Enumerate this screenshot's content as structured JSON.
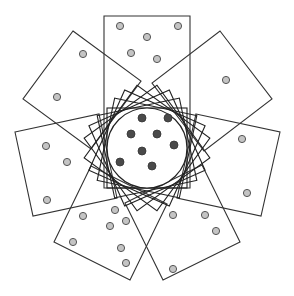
{
  "diagram": {
    "width": 294,
    "height": 296,
    "colors": {
      "background": "#ffffff",
      "stroke": "#333333",
      "light_dot": "#c4c4c4",
      "dark_dot": "#4a4a4a"
    },
    "center_circle": {
      "cx": 147,
      "cy": 148,
      "r": 40
    },
    "inner_rotated_squares": [
      {
        "angle": 0,
        "size": 80
      },
      {
        "angle": 12,
        "size": 84
      },
      {
        "angle": 24,
        "size": 88
      },
      {
        "angle": -12,
        "size": 84
      },
      {
        "angle": -24,
        "size": 88
      },
      {
        "angle": 36,
        "size": 90
      },
      {
        "angle": -36,
        "size": 90
      }
    ],
    "outer_frames": [
      {
        "name": "top",
        "points": [
          [
            104,
            16
          ],
          [
            190,
            16
          ],
          [
            190,
            188
          ],
          [
            104,
            188
          ]
        ]
      },
      {
        "name": "upper-left",
        "points": [
          [
            73,
            31
          ],
          [
            141,
            81
          ],
          [
            91,
            149
          ],
          [
            23,
            99
          ]
        ]
      },
      {
        "name": "upper-right",
        "points": [
          [
            220,
            31
          ],
          [
            272,
            99
          ],
          [
            204,
            151
          ],
          [
            152,
            83
          ]
        ]
      },
      {
        "name": "left",
        "points": [
          [
            15,
            132
          ],
          [
            99,
            114
          ],
          [
            117,
            198
          ],
          [
            33,
            216
          ]
        ]
      },
      {
        "name": "right",
        "points": [
          [
            196,
            114
          ],
          [
            280,
            132
          ],
          [
            261,
            216
          ],
          [
            177,
            198
          ]
        ]
      },
      {
        "name": "bottom-left",
        "points": [
          [
            91,
            166
          ],
          [
            167,
            204
          ],
          [
            130,
            280
          ],
          [
            54,
            242
          ]
        ]
      },
      {
        "name": "bottom-right",
        "points": [
          [
            125,
            203
          ],
          [
            202,
            165
          ],
          [
            240,
            242
          ],
          [
            163,
            280
          ]
        ]
      }
    ],
    "dark_dots": [
      [
        142,
        118
      ],
      [
        168,
        118
      ],
      [
        131,
        134
      ],
      [
        157,
        134
      ],
      [
        174,
        145
      ],
      [
        142,
        151
      ],
      [
        120,
        162
      ],
      [
        152,
        166
      ]
    ],
    "light_dots": [
      [
        120,
        26
      ],
      [
        178,
        26
      ],
      [
        147,
        37
      ],
      [
        131,
        53
      ],
      [
        157,
        59
      ],
      [
        83,
        54
      ],
      [
        57,
        97
      ],
      [
        226,
        80
      ],
      [
        46,
        146
      ],
      [
        67,
        162
      ],
      [
        47,
        200
      ],
      [
        242,
        139
      ],
      [
        247,
        193
      ],
      [
        83,
        216
      ],
      [
        115,
        210
      ],
      [
        126,
        221
      ],
      [
        110,
        226
      ],
      [
        73,
        242
      ],
      [
        121,
        248
      ],
      [
        126,
        263
      ],
      [
        173,
        215
      ],
      [
        205,
        215
      ],
      [
        216,
        231
      ],
      [
        173,
        269
      ]
    ]
  }
}
